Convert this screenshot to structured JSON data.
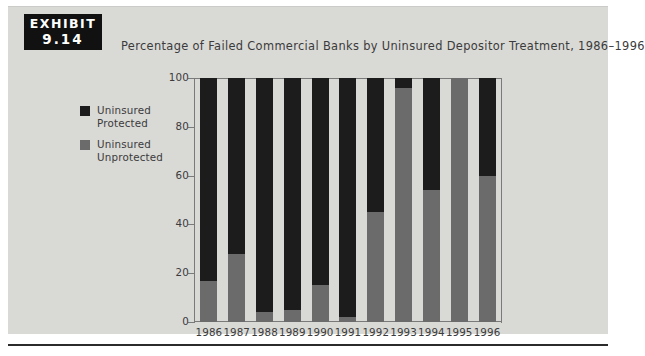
{
  "exhibit": {
    "label": "EXHIBIT",
    "number": "9.14"
  },
  "chart_data": {
    "type": "bar",
    "title": "Percentage of Failed Commercial Banks by Uninsured Depositor Treatment, 1986–1996",
    "xlabel": "",
    "ylabel": "",
    "ylim": [
      0,
      100
    ],
    "yticks": [
      0,
      20,
      40,
      60,
      80,
      100
    ],
    "grid": false,
    "stacked": true,
    "legend_position": "left",
    "categories": [
      "1986",
      "1987",
      "1988",
      "1989",
      "1990",
      "1991",
      "1992",
      "1993",
      "1994",
      "1995",
      "1996"
    ],
    "series": [
      {
        "name": "Uninsured Unprotected",
        "color": "#6b6b6b",
        "values": [
          17,
          28,
          4,
          5,
          15,
          2,
          45,
          96,
          54,
          100,
          60
        ]
      },
      {
        "name": "Uninsured Protected",
        "color": "#1c1c1c",
        "values": [
          83,
          72,
          96,
          95,
          85,
          98,
          55,
          4,
          46,
          0,
          40
        ]
      }
    ]
  }
}
